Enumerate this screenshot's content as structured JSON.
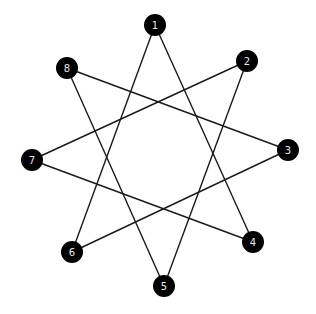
{
  "diagram": {
    "type": "star-graph",
    "colors": {
      "background": "#ffffff",
      "edge": "#1a1a1a",
      "node_fill": "#000000",
      "node_label": "#e8e8e8"
    },
    "node_radius": 11,
    "nodes": [
      {
        "id": "1",
        "label": "1",
        "x": 155,
        "y": 25
      },
      {
        "id": "2",
        "label": "2",
        "x": 247,
        "y": 61
      },
      {
        "id": "3",
        "label": "3",
        "x": 288,
        "y": 150
      },
      {
        "id": "4",
        "label": "4",
        "x": 253,
        "y": 242
      },
      {
        "id": "5",
        "label": "5",
        "x": 164,
        "y": 286
      },
      {
        "id": "6",
        "label": "6",
        "x": 72,
        "y": 252
      },
      {
        "id": "7",
        "label": "7",
        "x": 32,
        "y": 160
      },
      {
        "id": "8",
        "label": "8",
        "x": 67,
        "y": 68
      }
    ],
    "edges": [
      {
        "from": "1",
        "to": "4"
      },
      {
        "from": "1",
        "to": "6"
      },
      {
        "from": "2",
        "to": "5"
      },
      {
        "from": "2",
        "to": "7"
      },
      {
        "from": "3",
        "to": "6"
      },
      {
        "from": "3",
        "to": "8"
      },
      {
        "from": "4",
        "to": "7"
      },
      {
        "from": "5",
        "to": "8"
      }
    ]
  }
}
